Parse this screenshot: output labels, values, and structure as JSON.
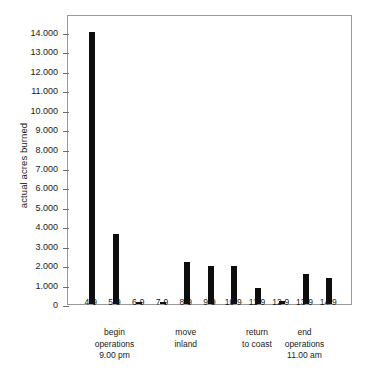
{
  "chart_data": {
    "type": "bar",
    "title": "",
    "xlabel": "",
    "ylabel": "actual acres burned",
    "categories": [
      "4-9",
      "5-9",
      "6-9",
      "7-9",
      "8-9",
      "9-9",
      "10-9",
      "11-9",
      "12-9",
      "13-9",
      "14-9"
    ],
    "values": [
      14000,
      3600,
      100,
      100,
      2150,
      1950,
      1950,
      800,
      150,
      1550,
      1350
    ],
    "ylim": [
      0,
      14000
    ],
    "ytick_values": [
      0,
      1000,
      2000,
      3000,
      4000,
      5000,
      6000,
      7000,
      8000,
      9000,
      10000,
      11000,
      12000,
      13000,
      14000
    ],
    "ytick_labels": [
      "0",
      "1.000",
      "2.000",
      "3.000",
      "4.000",
      "5.000",
      "6.000",
      "7.000",
      "8.000",
      "9.000",
      "10.000",
      "11.000",
      "12.000",
      "13.000",
      "14.000"
    ],
    "grid": false,
    "legend": "none",
    "bar_color": "#0d0d0d",
    "frame_color": "#9a9a9a",
    "annotations": [
      {
        "category": "5-9",
        "text": "begin\noperations\n9.00 pm"
      },
      {
        "category": "8-9",
        "text": "move\ninland"
      },
      {
        "category": "11-9",
        "text": "return\nto coast"
      },
      {
        "category": "13-9",
        "text": "end\noperations\n11.00 am"
      }
    ]
  }
}
